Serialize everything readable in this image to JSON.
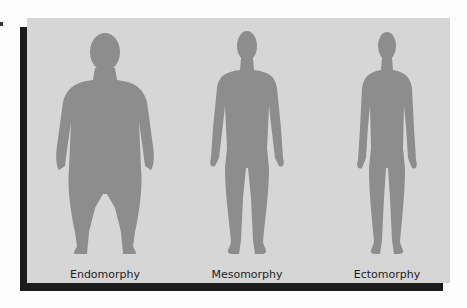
{
  "diagram": {
    "colors": {
      "panel": "#d6d6d6",
      "silhouette": "#8d8d8d",
      "shadow": "#1c1c1c"
    },
    "figures": [
      {
        "label": "Endomorphy",
        "shape": "endomorph-silhouette"
      },
      {
        "label": "Mesomorphy",
        "shape": "mesomorph-silhouette"
      },
      {
        "label": "Ectomorphy",
        "shape": "ectomorph-silhouette"
      }
    ]
  }
}
